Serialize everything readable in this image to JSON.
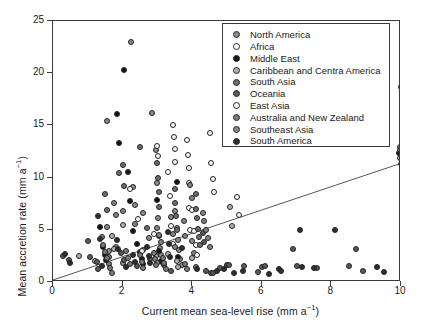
{
  "chart_data": {
    "type": "scatter",
    "title": "",
    "xlabel": "Current mean sea-level rise (mm a⁻¹)",
    "ylabel": "Mean accretion rate (mm a⁻¹)",
    "xlim": [
      0,
      10
    ],
    "ylim": [
      0,
      25
    ],
    "xticks": [
      0,
      2,
      4,
      6,
      8,
      10
    ],
    "yticks": [
      0,
      5,
      10,
      15,
      20,
      25
    ],
    "grid": false,
    "legend_position": "top-right",
    "trendline": {
      "label": "regression line",
      "x": [
        0,
        10
      ],
      "y": [
        0,
        11.2
      ],
      "color": "#555555"
    },
    "series": [
      {
        "name": "North America",
        "color": "#8c8c8c",
        "points": [
          [
            1.55,
            5.3
          ],
          [
            1.6,
            3.0
          ],
          [
            1.62,
            2.4
          ],
          [
            1.8,
            3.4
          ],
          [
            2.0,
            1.8
          ],
          [
            2.25,
            23.0
          ],
          [
            2.3,
            9.1
          ],
          [
            2.35,
            7.4
          ],
          [
            2.6,
            6.6
          ],
          [
            2.75,
            4.2
          ],
          [
            2.95,
            12.6
          ],
          [
            3.0,
            9.5
          ],
          [
            3.02,
            6.1
          ],
          [
            3.05,
            4.4
          ],
          [
            3.08,
            3.3
          ],
          [
            3.1,
            2.6
          ],
          [
            3.12,
            1.9
          ],
          [
            3.5,
            6.8
          ],
          [
            3.55,
            5.2
          ],
          [
            3.6,
            4.0
          ],
          [
            3.62,
            3.1
          ],
          [
            3.65,
            2.2
          ],
          [
            3.7,
            1.6
          ],
          [
            4.0,
            3.9
          ],
          [
            4.05,
            2.8
          ],
          [
            9.98,
            12.9
          ],
          [
            10.0,
            12.0
          ]
        ]
      },
      {
        "name": "Africa",
        "color": "#ffffff",
        "points": [
          [
            2.2,
            8.9
          ],
          [
            2.45,
            6.0
          ],
          [
            2.9,
            4.6
          ],
          [
            3.3,
            10.5
          ],
          [
            3.35,
            8.2
          ],
          [
            3.4,
            5.4
          ],
          [
            3.45,
            3.6
          ],
          [
            3.9,
            7.1
          ],
          [
            3.95,
            5.0
          ],
          [
            4.0,
            6.9
          ],
          [
            4.05,
            4.9
          ],
          [
            4.1,
            3.5
          ],
          [
            4.15,
            2.6
          ],
          [
            9.99,
            11.3
          ]
        ]
      },
      {
        "name": "Middle East",
        "color": "#141414",
        "points": [
          [
            1.35,
            5.3
          ],
          [
            1.45,
            3.4
          ],
          [
            1.5,
            2.6
          ],
          [
            1.52,
            2.1
          ],
          [
            1.85,
            16.1
          ],
          [
            1.9,
            13.3
          ],
          [
            2.05,
            20.3
          ],
          [
            2.15,
            10.5
          ],
          [
            2.2,
            7.8
          ],
          [
            2.3,
            4.9
          ],
          [
            2.4,
            3.6
          ],
          [
            2.5,
            2.9
          ],
          [
            2.55,
            2.2
          ],
          [
            2.6,
            1.7
          ],
          [
            3.0,
            7.9
          ],
          [
            3.05,
            3.0
          ],
          [
            3.1,
            2.0
          ],
          [
            3.55,
            9.6
          ],
          [
            3.6,
            2.4
          ],
          [
            9.95,
            12.4
          ]
        ]
      },
      {
        "name": "Caribbean and Centra America",
        "color": "#b0b0b0",
        "points": [
          [
            0.75,
            2.5
          ],
          [
            1.2,
            2.0
          ],
          [
            1.7,
            4.4
          ],
          [
            1.75,
            3.2
          ],
          [
            2.0,
            5.5
          ],
          [
            2.6,
            3.1
          ],
          [
            2.95,
            2.5
          ],
          [
            3.0,
            1.8
          ],
          [
            3.3,
            2.7
          ],
          [
            3.55,
            2.0
          ],
          [
            3.58,
            1.4
          ],
          [
            4.0,
            2.3
          ],
          [
            5.1,
            7.2
          ],
          [
            5.15,
            5.4
          ],
          [
            9.97,
            11.9
          ]
        ]
      },
      {
        "name": "South Asia",
        "color": "#6e6e6e",
        "points": [
          [
            1.5,
            8.4
          ],
          [
            1.55,
            6.9
          ],
          [
            1.9,
            10.4
          ],
          [
            2.0,
            11.2
          ],
          [
            2.05,
            9.2
          ],
          [
            2.5,
            12.9
          ],
          [
            2.7,
            5.2
          ],
          [
            3.0,
            11.4
          ],
          [
            3.02,
            10.0
          ],
          [
            3.04,
            8.6
          ],
          [
            3.06,
            7.2
          ],
          [
            3.5,
            8.9
          ],
          [
            3.52,
            7.6
          ],
          [
            3.54,
            6.3
          ],
          [
            3.56,
            5.0
          ],
          [
            4.1,
            8.4
          ],
          [
            4.12,
            7.0
          ],
          [
            4.15,
            6.1
          ],
          [
            4.18,
            5.1
          ],
          [
            4.2,
            4.3
          ],
          [
            4.22,
            3.5
          ],
          [
            10.0,
            18.7
          ]
        ]
      },
      {
        "name": "Oceania",
        "color": "#595959",
        "points": [
          [
            0.3,
            2.5
          ],
          [
            0.45,
            2.1
          ],
          [
            1.0,
            3.9
          ],
          [
            1.05,
            2.4
          ],
          [
            1.25,
            1.9
          ],
          [
            1.3,
            1.2
          ],
          [
            1.95,
            2.8
          ],
          [
            2.05,
            2.1
          ],
          [
            2.4,
            1.5
          ],
          [
            2.8,
            2.2
          ],
          [
            3.2,
            1.6
          ],
          [
            3.4,
            1.1
          ],
          [
            4.3,
            4.7
          ],
          [
            4.35,
            3.8
          ],
          [
            4.4,
            1.1
          ],
          [
            4.55,
            0.9
          ],
          [
            4.6,
            0.85
          ],
          [
            4.8,
            1.3
          ],
          [
            5.0,
            1.6
          ],
          [
            5.05,
            1.65
          ],
          [
            5.5,
            1.5
          ],
          [
            5.9,
            0.95
          ],
          [
            6.0,
            1.4
          ],
          [
            6.1,
            1.55
          ],
          [
            6.9,
            3.2
          ],
          [
            7.0,
            1.5
          ],
          [
            7.6,
            1.3
          ],
          [
            8.5,
            1.5
          ],
          [
            8.7,
            3.2
          ],
          [
            8.9,
            1.1
          ]
        ]
      },
      {
        "name": "East Asia",
        "color": "#f2f2f2",
        "points": [
          [
            2.55,
            3.0
          ],
          [
            3.0,
            13.0
          ],
          [
            3.02,
            12.1
          ],
          [
            3.45,
            15.0
          ],
          [
            3.48,
            13.9
          ],
          [
            3.5,
            12.7
          ],
          [
            3.52,
            11.5
          ],
          [
            3.85,
            13.6
          ],
          [
            3.88,
            12.2
          ],
          [
            3.9,
            10.9
          ],
          [
            3.92,
            9.5
          ],
          [
            4.5,
            14.3
          ],
          [
            4.55,
            11.4
          ],
          [
            4.6,
            9.9
          ],
          [
            4.62,
            8.6
          ],
          [
            5.3,
            8.1
          ],
          [
            5.35,
            6.4
          ]
        ]
      },
      {
        "name": "Australia and New Zealand",
        "color": "#7a7a7a",
        "points": [
          [
            1.4,
            4.3
          ],
          [
            1.45,
            3.5
          ],
          [
            1.5,
            2.9
          ],
          [
            1.55,
            2.3
          ],
          [
            1.6,
            1.7
          ],
          [
            1.65,
            1.3
          ],
          [
            1.7,
            0.9
          ],
          [
            2.1,
            3.0
          ],
          [
            2.15,
            2.3
          ],
          [
            2.2,
            1.7
          ],
          [
            2.5,
            2.6
          ],
          [
            2.55,
            1.9
          ],
          [
            2.6,
            1.3
          ],
          [
            2.9,
            2.8
          ],
          [
            2.92,
            2.2
          ],
          [
            2.95,
            1.6
          ],
          [
            3.15,
            2.3
          ],
          [
            3.2,
            1.8
          ],
          [
            3.25,
            1.2
          ],
          [
            3.8,
            1.7
          ],
          [
            3.85,
            1.2
          ],
          [
            4.1,
            1.4
          ]
        ]
      },
      {
        "name": "Southeast Asia",
        "color": "#848484",
        "points": [
          [
            1.55,
            15.4
          ],
          [
            1.75,
            7.6
          ],
          [
            1.8,
            6.4
          ],
          [
            2.0,
            6.8
          ],
          [
            2.35,
            5.6
          ],
          [
            2.85,
            16.2
          ],
          [
            3.0,
            5.2
          ],
          [
            3.05,
            4.5
          ],
          [
            3.1,
            3.8
          ],
          [
            3.4,
            6.2
          ],
          [
            3.45,
            4.6
          ],
          [
            3.5,
            3.4
          ],
          [
            3.75,
            5.8
          ],
          [
            3.78,
            4.4
          ],
          [
            3.95,
            9.3
          ],
          [
            4.0,
            8.0
          ],
          [
            4.3,
            6.6
          ],
          [
            4.35,
            5.8
          ],
          [
            4.4,
            5.0
          ],
          [
            4.45,
            4.2
          ],
          [
            4.5,
            3.4
          ],
          [
            9.96,
            12.6
          ]
        ]
      },
      {
        "name": "South America",
        "color": "#2e2e2e",
        "points": [
          [
            0.35,
            2.7
          ],
          [
            0.5,
            1.8
          ],
          [
            1.3,
            6.3
          ],
          [
            1.35,
            4.1
          ],
          [
            1.4,
            1.5
          ],
          [
            1.85,
            4.0
          ],
          [
            1.88,
            3.2
          ],
          [
            2.1,
            1.4
          ],
          [
            2.3,
            2.6
          ],
          [
            2.35,
            1.9
          ],
          [
            2.7,
            3.4
          ],
          [
            2.75,
            2.5
          ],
          [
            2.78,
            1.8
          ],
          [
            3.3,
            4.8
          ],
          [
            3.32,
            3.6
          ],
          [
            3.35,
            2.4
          ],
          [
            3.7,
            3.3
          ],
          [
            4.15,
            1.2
          ],
          [
            4.7,
            1.1
          ],
          [
            4.9,
            1.2
          ],
          [
            5.2,
            0.9
          ],
          [
            5.45,
            1.05
          ],
          [
            6.2,
            0.8
          ],
          [
            6.5,
            1.2
          ],
          [
            6.55,
            1.1
          ],
          [
            7.1,
            5.0
          ],
          [
            7.15,
            1.4
          ],
          [
            7.5,
            1.3
          ],
          [
            8.1,
            5.0
          ],
          [
            9.3,
            1.4
          ],
          [
            9.5,
            0.95
          ]
        ]
      }
    ],
    "legend_entries": [
      {
        "label": "North America",
        "color": "#8c8c8c"
      },
      {
        "label": "Africa",
        "color": "#ffffff"
      },
      {
        "label": "Middle East",
        "color": "#141414"
      },
      {
        "label": "Caribbean and Centra America",
        "color": "#b0b0b0"
      },
      {
        "label": "South Asia",
        "color": "#6e6e6e"
      },
      {
        "label": "Oceania",
        "color": "#595959"
      },
      {
        "label": "East Asia",
        "color": "#f2f2f2"
      },
      {
        "label": "Australia and New Zealand",
        "color": "#7a7a7a"
      },
      {
        "label": "Southeast Asia",
        "color": "#848484"
      },
      {
        "label": "South America",
        "color": "#2e2e2e"
      }
    ]
  },
  "axis": {
    "y_title_main": "Mean accretion rate (mm a",
    "y_title_sup": "−1",
    "y_title_end": ")",
    "x_title_main": "Current mean sea-level rise (mm a",
    "x_title_sup": "−1",
    "x_title_end": ")"
  }
}
